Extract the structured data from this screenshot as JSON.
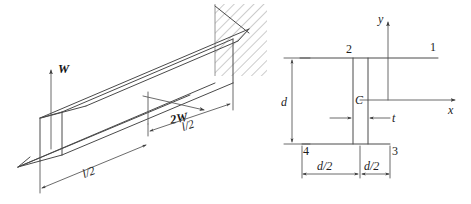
{
  "figure": {
    "line_color": "#4a4a4a",
    "hatch_color": "#8a8a8a",
    "text_color": "#1c1c1c",
    "background": "#ffffff"
  },
  "beam_diagram": {
    "name": "isometric-cantilever-beam",
    "support": "fixed-wall-hatched",
    "labels": {
      "vertical_force": "W",
      "horizontal_force": "2W",
      "length_near": "l/2",
      "length_far": "l/2"
    }
  },
  "section_diagram": {
    "name": "z-section-cross-section",
    "axes": {
      "y_label": "y",
      "x_label": "x"
    },
    "centroid_label": "C",
    "corner_points": {
      "p1": "1",
      "p2": "2",
      "p3": "3",
      "p4": "4"
    },
    "dimensions": {
      "depth": "d",
      "thickness": "t",
      "half_width_left": "d/2",
      "half_width_right": "d/2"
    }
  }
}
